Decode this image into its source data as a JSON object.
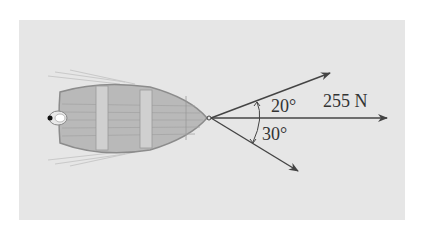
{
  "diagram": {
    "type": "force-vector diagram",
    "vectors": [
      {
        "name": "upper-rope",
        "angle_from_axis_deg": 20,
        "direction": "above resultant"
      },
      {
        "name": "resultant",
        "magnitude_label": "255 N",
        "direction": "horizontal right"
      },
      {
        "name": "lower-rope",
        "angle_from_axis_deg": 30,
        "direction": "below resultant"
      }
    ],
    "labels": {
      "angle_upper": "20°",
      "angle_lower": "30°",
      "force": "255 N"
    },
    "colors": {
      "background": "#ffffff",
      "panel": "#e6e6e6",
      "boat_fill": "#b8b8b8",
      "boat_outline": "#8a8a8a",
      "arrow": "#444444",
      "text": "#333333"
    }
  }
}
